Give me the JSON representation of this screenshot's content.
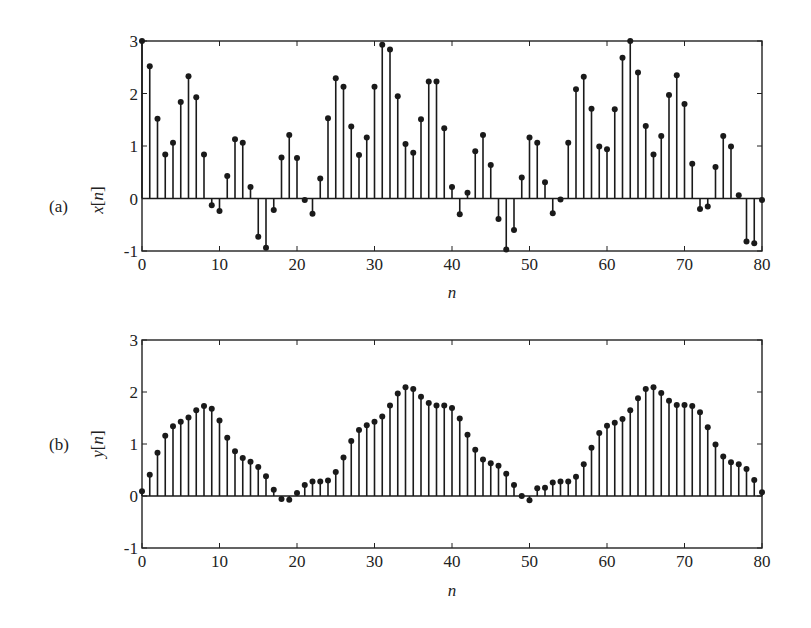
{
  "chart_data": [
    {
      "type": "stem",
      "panel_label": "(a)",
      "title": "",
      "xlabel": "n",
      "ylabel": "x[n]",
      "xlim": [
        0,
        80
      ],
      "ylim": [
        -1,
        3
      ],
      "xticks": [
        0,
        10,
        20,
        30,
        40,
        50,
        60,
        70,
        80
      ],
      "yticks": [
        -1,
        0,
        1,
        2,
        3
      ],
      "grid": false,
      "legend": null,
      "x": [
        0,
        1,
        2,
        3,
        4,
        5,
        6,
        7,
        8,
        9,
        10,
        11,
        12,
        13,
        14,
        15,
        16,
        17,
        18,
        19,
        20,
        21,
        22,
        23,
        24,
        25,
        26,
        27,
        28,
        29,
        30,
        31,
        32,
        33,
        34,
        35,
        36,
        37,
        38,
        39,
        40,
        41,
        42,
        43,
        44,
        45,
        46,
        47,
        48,
        49,
        50,
        51,
        52,
        53,
        54,
        55,
        56,
        57,
        58,
        59,
        60,
        61,
        62,
        63,
        64,
        65,
        66,
        67,
        68,
        69,
        70,
        71,
        72,
        73,
        74,
        75,
        76,
        77,
        78,
        79,
        80
      ],
      "values": [
        3.0,
        2.52,
        1.52,
        0.84,
        1.06,
        1.84,
        2.33,
        1.93,
        0.84,
        -0.13,
        -0.24,
        0.43,
        1.13,
        1.06,
        0.22,
        -0.73,
        -0.94,
        -0.22,
        0.78,
        1.21,
        0.77,
        -0.03,
        -0.29,
        0.38,
        1.53,
        2.29,
        2.13,
        1.37,
        0.83,
        1.16,
        2.13,
        2.93,
        2.84,
        1.95,
        1.04,
        0.87,
        1.51,
        2.23,
        2.23,
        1.34,
        0.22,
        -0.3,
        0.11,
        0.9,
        1.21,
        0.64,
        -0.39,
        -0.97,
        -0.6,
        0.4,
        1.16,
        1.06,
        0.31,
        -0.28,
        -0.02,
        1.06,
        2.08,
        2.32,
        1.71,
        0.99,
        0.94,
        1.7,
        2.68,
        3.0,
        2.4,
        1.38,
        0.84,
        1.19,
        1.97,
        2.35,
        1.8,
        0.66,
        -0.2,
        -0.15,
        0.6,
        1.19,
        0.99,
        0.06,
        -0.82,
        -0.85,
        -0.03
      ]
    },
    {
      "type": "stem",
      "panel_label": "(b)",
      "title": "",
      "xlabel": "n",
      "ylabel": "y[n]",
      "xlim": [
        0,
        80
      ],
      "ylim": [
        -1,
        3
      ],
      "xticks": [
        0,
        10,
        20,
        30,
        40,
        50,
        60,
        70,
        80
      ],
      "yticks": [
        -1,
        0,
        1,
        2,
        3
      ],
      "grid": false,
      "legend": null,
      "x": [
        0,
        1,
        2,
        3,
        4,
        5,
        6,
        7,
        8,
        9,
        10,
        11,
        12,
        13,
        14,
        15,
        16,
        17,
        18,
        19,
        20,
        21,
        22,
        23,
        24,
        25,
        26,
        27,
        28,
        29,
        30,
        31,
        32,
        33,
        34,
        35,
        36,
        37,
        38,
        39,
        40,
        41,
        42,
        43,
        44,
        45,
        46,
        47,
        48,
        49,
        50,
        51,
        52,
        53,
        54,
        55,
        56,
        57,
        58,
        59,
        60,
        61,
        62,
        63,
        64,
        65,
        66,
        67,
        68,
        69,
        70,
        71,
        72,
        73,
        74,
        75,
        76,
        77,
        78,
        79,
        80
      ],
      "values": [
        0.09,
        0.41,
        0.83,
        1.16,
        1.34,
        1.43,
        1.51,
        1.65,
        1.73,
        1.68,
        1.45,
        1.12,
        0.86,
        0.73,
        0.66,
        0.56,
        0.38,
        0.12,
        -0.06,
        -0.07,
        0.06,
        0.21,
        0.28,
        0.28,
        0.3,
        0.46,
        0.74,
        1.06,
        1.27,
        1.36,
        1.43,
        1.53,
        1.74,
        1.97,
        2.09,
        2.06,
        1.91,
        1.79,
        1.74,
        1.74,
        1.69,
        1.49,
        1.18,
        0.89,
        0.7,
        0.63,
        0.58,
        0.43,
        0.21,
        0.0,
        -0.08,
        0.15,
        0.16,
        0.26,
        0.28,
        0.28,
        0.37,
        0.61,
        0.93,
        1.21,
        1.35,
        1.41,
        1.48,
        1.65,
        1.88,
        2.06,
        2.09,
        1.98,
        1.83,
        1.75,
        1.75,
        1.73,
        1.61,
        1.32,
        0.99,
        0.76,
        0.65,
        0.61,
        0.52,
        0.31,
        0.07
      ]
    }
  ],
  "panels": [
    {
      "label": "(a)",
      "ylabel_main": "x",
      "ylabel_arg": "n",
      "xlabel": "n"
    },
    {
      "label": "(b)",
      "ylabel_main": "y",
      "ylabel_arg": "n",
      "xlabel": "n"
    }
  ],
  "style": {
    "stem_color": "#1a1a1a",
    "axis_color": "#222222",
    "background": "#ffffff"
  }
}
